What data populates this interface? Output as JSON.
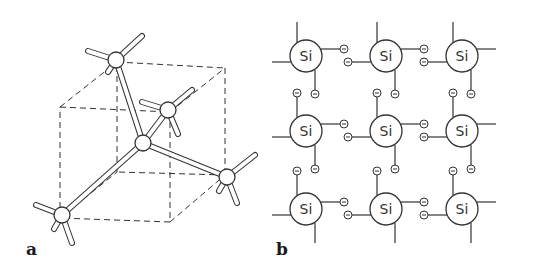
{
  "figure": {
    "panels": [
      {
        "label": "a",
        "description": "3D ball-and-stick model of a silicon atom tetrahedrally bonded to four neighbours inside a dashed cube",
        "cube": {
          "front": [
            [
              60,
              107
            ],
            [
              170,
              112
            ],
            [
              170,
              222
            ],
            [
              60,
              218
            ]
          ],
          "back": [
            [
              117,
              62
            ],
            [
              225,
              68
            ],
            [
              225,
              175
            ],
            [
              117,
              172
            ]
          ]
        },
        "atoms": [
          {
            "id": "center",
            "x": 143,
            "y": 143
          },
          {
            "id": "top",
            "x": 116,
            "y": 60
          },
          {
            "id": "upper-right",
            "x": 168,
            "y": 110
          },
          {
            "id": "right",
            "x": 227,
            "y": 177
          },
          {
            "id": "bottom-left",
            "x": 62,
            "y": 215
          }
        ],
        "bonds": [
          [
            "center",
            "top"
          ],
          [
            "center",
            "upper-right"
          ],
          [
            "center",
            "right"
          ],
          [
            "center",
            "bottom-left"
          ]
        ]
      },
      {
        "label": "b",
        "description": "2D lattice of silicon atoms with paired bonding electrons",
        "atom_symbol": "Si",
        "electron_symbol": "−",
        "grid": {
          "rows": 3,
          "cols": 3,
          "x": [
            306,
            386,
            462
          ],
          "y": [
            56,
            131,
            209
          ],
          "radius": 16
        }
      }
    ]
  },
  "colors": {
    "ink": "#333333",
    "background": "#ffffff"
  }
}
